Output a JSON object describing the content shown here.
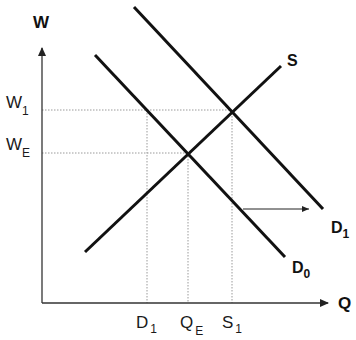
{
  "diagram": {
    "type": "supply-demand",
    "axes": {
      "y_label": "W",
      "x_label": "Q"
    },
    "curves": [
      {
        "id": "S",
        "label": "S",
        "label_sub": ""
      },
      {
        "id": "D0",
        "label": "D",
        "label_sub": "0"
      },
      {
        "id": "D1",
        "label": "D",
        "label_sub": "1"
      }
    ],
    "y_ticks": [
      {
        "id": "W1",
        "main": "W",
        "sub": "1"
      },
      {
        "id": "WE",
        "main": "W",
        "sub": "E"
      }
    ],
    "x_ticks": [
      {
        "id": "D1",
        "main": "D",
        "sub": "1"
      },
      {
        "id": "QE",
        "main": "Q",
        "sub": "E"
      },
      {
        "id": "S1",
        "main": "S",
        "sub": "1"
      }
    ],
    "annotations": {
      "shift_arrow": "demand shift right from D0 to D1"
    },
    "colors": {
      "line": "#111111",
      "axis": "#333333",
      "guide": "#9a9a9a"
    }
  }
}
